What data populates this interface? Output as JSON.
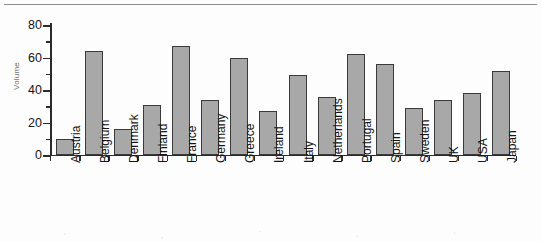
{
  "chart_data": {
    "type": "bar",
    "title": "",
    "subtitle": "",
    "xlabel": "",
    "ylabel": "Volume",
    "ylim": [
      0,
      80
    ],
    "ytick_labels": [
      "0",
      "20",
      "40",
      "60",
      "80"
    ],
    "ytick_values": [
      0,
      20,
      40,
      60,
      80
    ],
    "yminor_values": [
      10,
      30,
      50,
      70
    ],
    "grid": false,
    "legend": null,
    "bar_fill_color": "#a8a8a8",
    "bar_edge_color": "#3a3a3a",
    "axis_color": "#2b2b2b",
    "categories": [
      "Austria",
      "Belgium",
      "Denmark",
      "Finland",
      "France",
      "Germany",
      "Greece",
      "Ireland",
      "Italy",
      "Netherlands",
      "Portugal",
      "Spain",
      "Sweden",
      "UK",
      "USA",
      "Japan"
    ],
    "values": [
      10,
      64,
      16,
      31,
      67,
      34,
      60,
      27,
      49,
      36,
      62,
      56,
      29,
      34,
      38,
      52
    ]
  }
}
